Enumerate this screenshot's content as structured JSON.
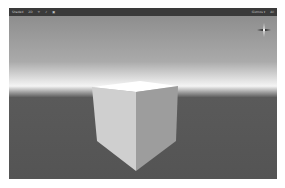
{
  "window": {
    "type": "Unity Scene view",
    "toolbar": {
      "left_items": [
        "Shaded",
        "2D",
        "☀",
        "♪",
        "▣"
      ],
      "right_items": [
        "Gizmos ▾",
        "All"
      ]
    }
  },
  "scene": {
    "object": "cube",
    "gizmo": "scene-orientation-gizmo",
    "colors": {
      "toolbar_bg": "#3a3a3a",
      "ground": "#545454",
      "horizon": "#f4f4f4",
      "sky": "#8e8e8e",
      "cube_top": "#ffffff",
      "cube_left": "#cfcfcf",
      "cube_right": "#9d9d9d"
    }
  }
}
